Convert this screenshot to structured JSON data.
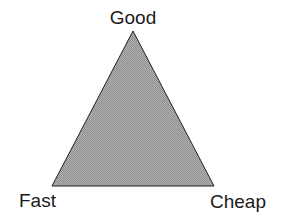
{
  "diagram": {
    "type": "triangle",
    "fill_color": "#a8a8a8",
    "stroke_color": "#222222",
    "vertices": {
      "top": {
        "label": "Good",
        "x": 133,
        "y": 31
      },
      "bottom_left": {
        "label": "Fast",
        "x": 52,
        "y": 186
      },
      "bottom_right": {
        "label": "Cheap",
        "x": 214,
        "y": 186
      }
    }
  }
}
